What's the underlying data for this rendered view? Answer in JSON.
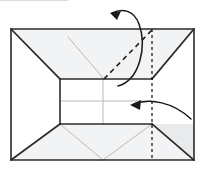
{
  "figure": {
    "type": "origami-crease-pattern",
    "canvas": {
      "width": 205,
      "height": 184
    },
    "background_color": "#ffffff"
  },
  "colors": {
    "outline": "#2b2b2b",
    "crease_light": "#b9b9b9",
    "fold_dashed": "#1f1f1f",
    "arrow": "#1a1a1a",
    "fill_panel": "#ffffff",
    "fill_flap": "#f2f3f5",
    "fill_flap_shadow": "#e9eaec"
  },
  "geometry": {
    "outer_rect": {
      "left": 11,
      "top": 29,
      "right": 194,
      "bottom": 160
    },
    "panel_rect": {
      "left": 60,
      "top": 79,
      "right": 152,
      "bottom": 124
    },
    "mid_x": 103,
    "mid_y": 101,
    "fold_line_x": 152,
    "top_flap_points": "11,29 194,29 152,79 60,79",
    "bottom_flap_points": "60,124 152,124 194,160 11,160",
    "left_flap_top_points": "11,29 60,79 11,79",
    "left_flap_bottom_points": "11,124 60,124 11,160",
    "right_flap_top_points": "194,29 194,79 152,79",
    "right_flap_bottom_points": "152,124 194,124 194,160"
  },
  "shapes": {
    "outer_boundary": {
      "name": "paper-outline",
      "points": "11,29 194,29 194,160 11,160"
    },
    "top_flap": {
      "name": "top-folded-flap",
      "points": "11,29 194,29 152,79 60,79"
    },
    "bottom_flap": {
      "name": "bottom-folded-flap",
      "points": "60,124 152,124 194,160 11,160"
    },
    "center_panel": {
      "name": "center-square-panel",
      "points": "60,79 152,79 152,124 60,124"
    }
  },
  "creases": [
    {
      "name": "top-flap-left-edge",
      "style": "solid-dark",
      "x1": 11,
      "y1": 29,
      "x2": 60,
      "y2": 79
    },
    {
      "name": "top-flap-right-edge",
      "style": "solid-dark",
      "x1": 194,
      "y1": 29,
      "x2": 152,
      "y2": 79
    },
    {
      "name": "top-flap-bottom-edge",
      "style": "solid-dark",
      "x1": 60,
      "y1": 79,
      "x2": 152,
      "y2": 79
    },
    {
      "name": "bottom-flap-left-edge",
      "style": "solid-dark",
      "x1": 11,
      "y1": 160,
      "x2": 60,
      "y2": 124
    },
    {
      "name": "bottom-flap-right-edge",
      "style": "solid-dark",
      "x1": 194,
      "y1": 160,
      "x2": 152,
      "y2": 124
    },
    {
      "name": "bottom-flap-top-edge",
      "style": "solid-dark",
      "x1": 60,
      "y1": 124,
      "x2": 152,
      "y2": 124
    },
    {
      "name": "panel-left-edge",
      "style": "solid-dark",
      "x1": 60,
      "y1": 79,
      "x2": 60,
      "y2": 124
    },
    {
      "name": "upper-diagonal-crease",
      "style": "light-gray",
      "x1": 68,
      "y1": 37,
      "x2": 104,
      "y2": 79
    },
    {
      "name": "panel-vertical-center-crease",
      "style": "light-gray",
      "x1": 103,
      "y1": 79,
      "x2": 103,
      "y2": 124
    },
    {
      "name": "panel-horizontal-center-crease",
      "style": "light-gray",
      "x1": 60,
      "y1": 101,
      "x2": 152,
      "y2": 101
    },
    {
      "name": "bottom-v-crease-left",
      "style": "light-gray",
      "x1": 60,
      "y1": 124,
      "x2": 103,
      "y2": 160
    },
    {
      "name": "bottom-v-crease-right",
      "style": "light-gray",
      "x1": 152,
      "y1": 124,
      "x2": 103,
      "y2": 160
    }
  ],
  "fold_lines": [
    {
      "name": "vertical-fold-line",
      "label": "vertical mountain fold",
      "style": "dashed",
      "x1": 152,
      "y1": 29,
      "x2": 152,
      "y2": 160,
      "dash_pattern": "3,3"
    },
    {
      "name": "diagonal-fold-line",
      "label": "diagonal valley fold",
      "style": "dashed",
      "x1": 104,
      "y1": 79,
      "x2": 152,
      "y2": 30,
      "dash_pattern": "5,4"
    }
  ],
  "arrows": [
    {
      "name": "upper-fold-arrow",
      "label": "fold top-right flap up and over to the left",
      "path": "M 118 86 C 140 80 146 46 139 24 C 134 10 122 8 112 13",
      "head_at": {
        "x": 112,
        "y": 13
      },
      "head_angle_deg": 205,
      "direction": "counterclockwise-up-left"
    },
    {
      "name": "lower-fold-arrow",
      "label": "fold right side over to the left",
      "path": "M 191 119 C 172 103 150 99 134 104",
      "head_at": {
        "x": 131,
        "y": 105
      },
      "head_angle_deg": 192,
      "direction": "right-to-left"
    }
  ]
}
